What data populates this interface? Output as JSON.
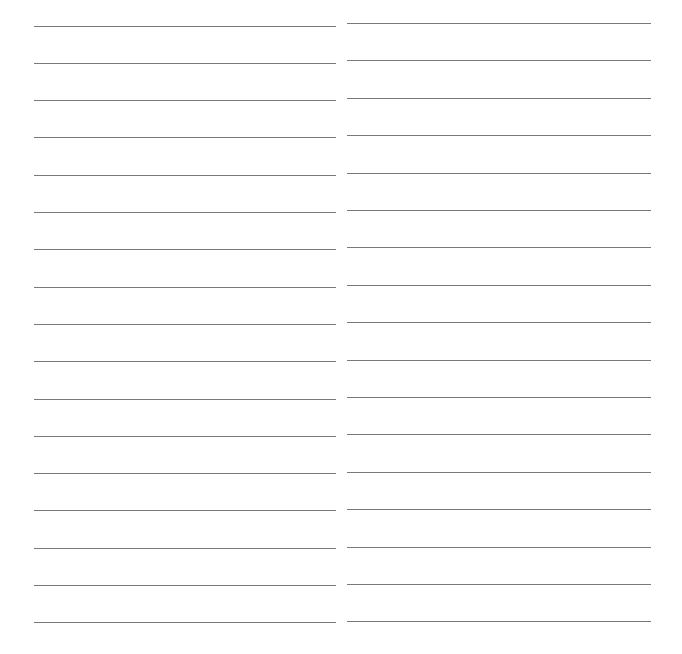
{
  "page": {
    "type": "blank lined paper",
    "background": "#ffffff",
    "line_color": "#7a7a7a",
    "columns": [
      {
        "name": "left",
        "x_start": 34,
        "x_end": 336,
        "first_line_y": 25.5,
        "line_spacing": 37.3,
        "line_count": 17
      },
      {
        "name": "right",
        "x_start": 347,
        "x_end": 651,
        "first_line_y": 23,
        "line_spacing": 37.4,
        "line_count": 17
      }
    ]
  }
}
